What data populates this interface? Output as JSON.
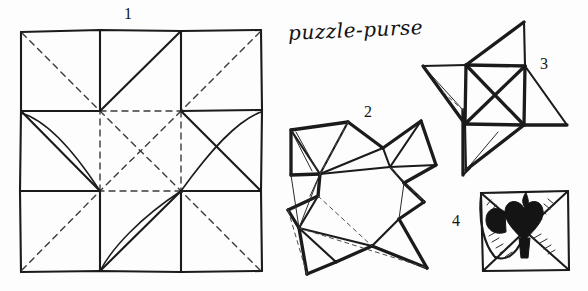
{
  "page": {
    "title_text": "puzzle-purse",
    "background_color": "#fdfdfd",
    "ink_color": "#1b1b1b",
    "width": 588,
    "height": 291
  },
  "figures": [
    {
      "number": "1",
      "name": "crease-pattern-square",
      "caption": "1"
    },
    {
      "number": "2",
      "name": "partially-folded-star",
      "caption": "2"
    },
    {
      "number": "3",
      "name": "pinwheel-form",
      "caption": "3"
    },
    {
      "number": "4",
      "name": "finished-purse-with-heart",
      "caption": "4"
    }
  ]
}
